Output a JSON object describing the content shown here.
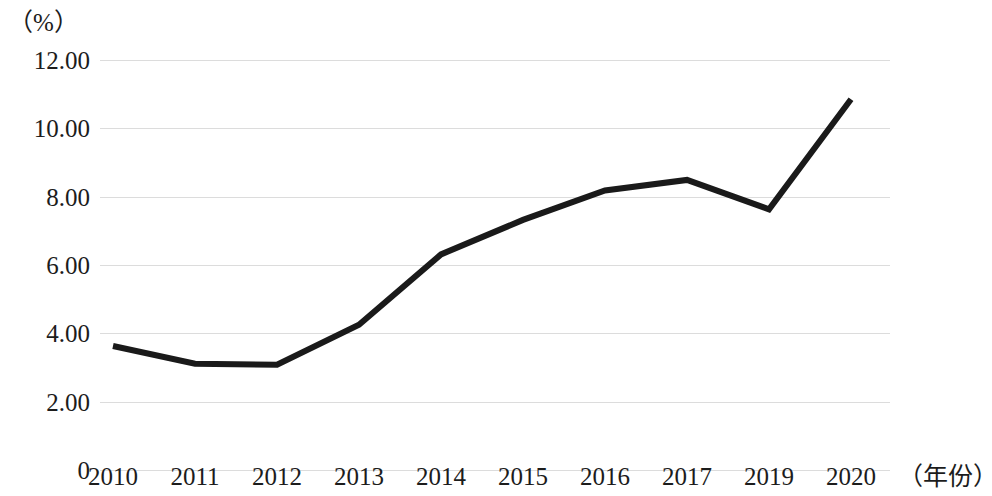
{
  "chart_data": {
    "type": "line",
    "title": "",
    "subtitle": "",
    "xlabel": "（年份）",
    "ylabel": "（%）",
    "categories": [
      "2010",
      "2011",
      "2012",
      "2013",
      "2014",
      "2015",
      "2016",
      "2017",
      "2019",
      "2020"
    ],
    "values": [
      3.63,
      3.11,
      3.08,
      4.25,
      6.31,
      7.32,
      8.18,
      8.49,
      7.63,
      10.85
    ],
    "series": [
      {
        "name": "",
        "values": [
          3.63,
          3.11,
          3.08,
          4.25,
          6.31,
          7.32,
          8.18,
          8.49,
          7.63,
          10.85
        ]
      }
    ],
    "ylim": [
      0,
      12
    ],
    "xlim_categories": [
      "2010",
      "2020"
    ],
    "y_ticks": [
      0,
      2,
      4,
      6,
      8,
      10,
      12
    ],
    "y_tick_labels": [
      "0",
      "2.00",
      "4.00",
      "6.00",
      "8.00",
      "10.00",
      "12.00"
    ],
    "x_tick_labels": [
      "2010",
      "2011",
      "2012",
      "2013",
      "2014",
      "2015",
      "2016",
      "2017",
      "2019",
      "2020"
    ],
    "grid": true,
    "grid_axis": "y",
    "legend": false,
    "legend_position": "none",
    "line_color": "#1a1a1a",
    "line_width_px": 6,
    "grid_color": "#dcdcdc",
    "background_color": "#ffffff",
    "markers": false,
    "annotations": []
  },
  "axes": {
    "y_unit_label": "（%）",
    "x_name_label": "（年份）"
  }
}
